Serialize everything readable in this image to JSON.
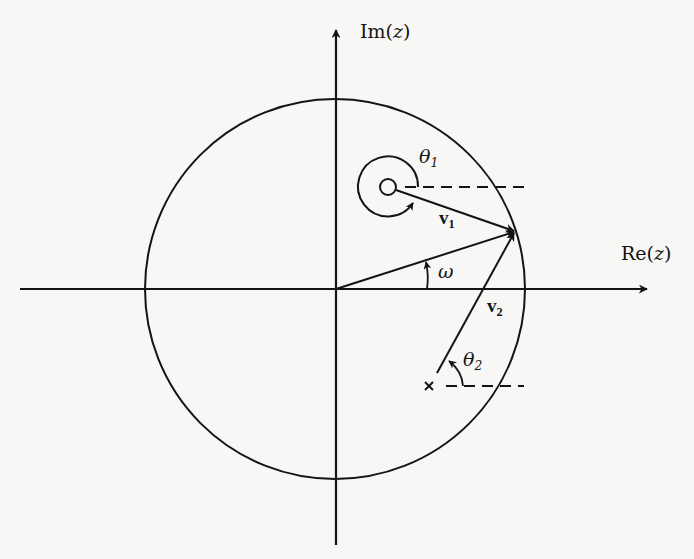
{
  "diagram": {
    "type": "z-plane pole-zero geometric evaluation",
    "axes": {
      "real_label_prefix": "Re(",
      "real_label_var": "z",
      "real_label_suffix": ")",
      "imag_label_prefix": "Im(",
      "imag_label_var": "z",
      "imag_label_suffix": ")"
    },
    "unit_circle": {
      "present": true
    },
    "zero": {
      "marker": "○",
      "angle_label": "θ",
      "angle_sub": "1",
      "vector_label": "v",
      "vector_sub": "1"
    },
    "pole": {
      "marker": "×",
      "angle_label": "θ",
      "angle_sub": "2",
      "vector_label": "v",
      "vector_sub": "2"
    },
    "frequency": {
      "angle_label": "ω"
    },
    "colors": {
      "ink": "#141414",
      "paper": "#f7f7f5"
    }
  }
}
